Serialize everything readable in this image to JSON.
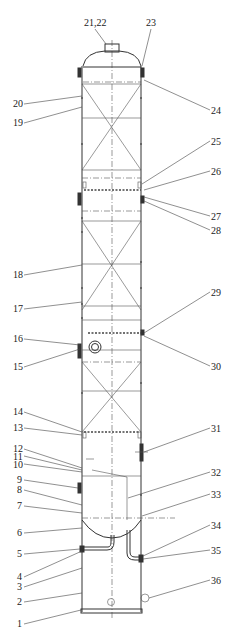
{
  "diagram": {
    "type": "distillation column / packed tower elevation drawing",
    "labels_left": [
      {
        "id": "l20",
        "text": "20",
        "x": 31,
        "y": 104
      },
      {
        "id": "l19",
        "text": "19",
        "x": 31,
        "y": 123
      },
      {
        "id": "l18",
        "text": "18",
        "x": 31,
        "y": 275
      },
      {
        "id": "l17",
        "text": "17",
        "x": 31,
        "y": 309
      },
      {
        "id": "l16",
        "text": "16",
        "x": 31,
        "y": 339
      },
      {
        "id": "l15",
        "text": "15",
        "x": 31,
        "y": 371
      },
      {
        "id": "l14",
        "text": "14",
        "x": 31,
        "y": 415
      },
      {
        "id": "l13",
        "text": "13",
        "x": 31,
        "y": 431
      },
      {
        "id": "l12",
        "text": "12",
        "x": 31,
        "y": 450
      },
      {
        "id": "l11",
        "text": "11",
        "x": 31,
        "y": 459
      },
      {
        "id": "l10",
        "text": "10",
        "x": 31,
        "y": 467
      },
      {
        "id": "l9",
        "text": "9",
        "x": 35,
        "y": 483
      },
      {
        "id": "l8",
        "text": "8",
        "x": 35,
        "y": 493
      },
      {
        "id": "l7",
        "text": "7",
        "x": 35,
        "y": 509
      },
      {
        "id": "l6",
        "text": "6",
        "x": 35,
        "y": 536
      },
      {
        "id": "l5",
        "text": "5",
        "x": 35,
        "y": 557
      },
      {
        "id": "l4",
        "text": "4",
        "x": 35,
        "y": 580
      },
      {
        "id": "l3",
        "text": "3",
        "x": 35,
        "y": 590
      },
      {
        "id": "l2",
        "text": "2",
        "x": 35,
        "y": 605
      },
      {
        "id": "l1",
        "text": "1",
        "x": 35,
        "y": 627
      }
    ],
    "labels_right": [
      {
        "id": "l21_22",
        "text": "21,22",
        "x": 84,
        "y": 26
      },
      {
        "id": "l23",
        "text": "23",
        "x": 146,
        "y": 26
      },
      {
        "id": "l24",
        "text": "24",
        "x": 211,
        "y": 114
      },
      {
        "id": "l25",
        "text": "25",
        "x": 211,
        "y": 145
      },
      {
        "id": "l26",
        "text": "26",
        "x": 211,
        "y": 175
      },
      {
        "id": "l27",
        "text": "27",
        "x": 211,
        "y": 220
      },
      {
        "id": "l28",
        "text": "28",
        "x": 211,
        "y": 234
      },
      {
        "id": "l29",
        "text": "29",
        "x": 211,
        "y": 296
      },
      {
        "id": "l30",
        "text": "30",
        "x": 211,
        "y": 370
      },
      {
        "id": "l31",
        "text": "31",
        "x": 211,
        "y": 432
      },
      {
        "id": "l32",
        "text": "32",
        "x": 211,
        "y": 476
      },
      {
        "id": "l33",
        "text": "33",
        "x": 211,
        "y": 498
      },
      {
        "id": "l34",
        "text": "34",
        "x": 211,
        "y": 529
      },
      {
        "id": "l35",
        "text": "35",
        "x": 211,
        "y": 554
      },
      {
        "id": "l36",
        "text": "36",
        "x": 211,
        "y": 584
      }
    ]
  }
}
